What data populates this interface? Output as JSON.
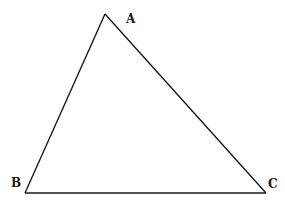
{
  "diagram": {
    "type": "triangle",
    "vertices": [
      {
        "label": "A",
        "x": 105,
        "y": 14,
        "label_x": 126,
        "label_y": 23
      },
      {
        "label": "B",
        "x": 25,
        "y": 193,
        "label_x": 11,
        "label_y": 187
      },
      {
        "label": "C",
        "x": 266,
        "y": 193,
        "label_x": 268,
        "label_y": 188
      }
    ],
    "stroke_color": "#1a1a1a",
    "background": "#ffffff"
  }
}
